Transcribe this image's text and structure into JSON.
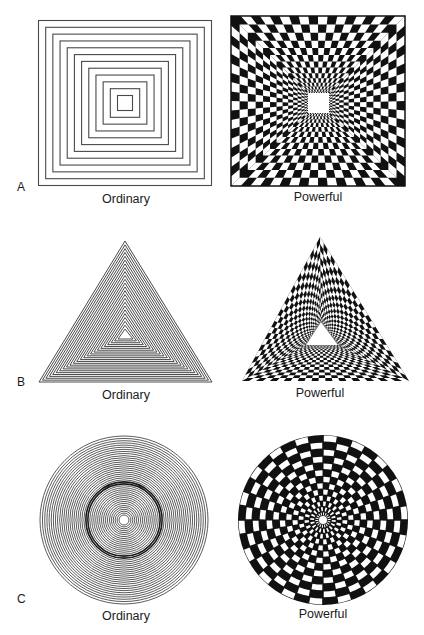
{
  "figure": {
    "ink_color": "#111111",
    "line_color": "#4a4a4a",
    "background": "#ffffff",
    "panels": [
      {
        "letter": "A",
        "letter_pos": [
          17,
          180
        ],
        "ordinary": {
          "caption": "Ordinary",
          "caption_pos": [
            126,
            192
          ],
          "shape": "square",
          "center": [
            125,
            103
          ],
          "outer_half_w": 86.5,
          "outer_half_h": 82.5,
          "inner_half_w": 7.5,
          "inner_half_h": 7.5,
          "rings": 12
        },
        "powerful": {
          "caption": "Powerful",
          "caption_pos": [
            318,
            190
          ],
          "shape": "square-tunnel-checker",
          "box": [
            231,
            16,
            405,
            186
          ],
          "hole": [
            308,
            93,
            329,
            113
          ],
          "rings": 14,
          "divisions": 18
        }
      },
      {
        "letter": "B",
        "letter_pos": [
          17,
          375
        ],
        "ordinary": {
          "caption": "Ordinary",
          "caption_pos": [
            126,
            388
          ],
          "shape": "triangle",
          "outer": [
            [
              125,
              241
            ],
            [
              39,
              382
            ],
            [
              212,
              382
            ]
          ],
          "inner": [
            [
              125,
              329
            ],
            [
              118,
              339
            ],
            [
              133,
              339
            ]
          ],
          "rings": 24
        },
        "powerful": {
          "caption": "Powerful",
          "caption_pos": [
            320,
            386
          ],
          "shape": "triangle-tunnel-checker",
          "outer": [
            [
              320,
              237
            ],
            [
              242,
              381
            ],
            [
              409,
              381
            ]
          ],
          "inner": [
            [
              321,
              322
            ],
            [
              306,
              345
            ],
            [
              338,
              345
            ]
          ],
          "rings": 18,
          "divisions": 24
        }
      },
      {
        "letter": "C",
        "letter_pos": [
          17,
          592
        ],
        "ordinary": {
          "caption": "Ordinary",
          "caption_pos": [
            126,
            609
          ],
          "shape": "circle",
          "center": [
            124,
            520
          ],
          "outer_r": 84,
          "inner_r": 5,
          "rings": 40
        },
        "powerful": {
          "caption": "Powerful",
          "caption_pos": [
            323,
            607
          ],
          "shape": "polar-checker",
          "center": [
            323,
            520
          ],
          "outer_r": 85,
          "inner_r": 4,
          "rings": 13,
          "sectors": 36
        }
      }
    ]
  }
}
